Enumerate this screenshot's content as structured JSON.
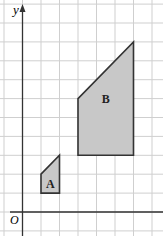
{
  "diagram": {
    "axis_labels": {
      "x": "x",
      "y": "y",
      "origin": "O"
    },
    "grid": {
      "x_range": [
        -1,
        7
      ],
      "y_range": [
        -1,
        11
      ]
    },
    "shapes": [
      {
        "label": "A",
        "vertices": [
          [
            1,
            1
          ],
          [
            2,
            1
          ],
          [
            2,
            3
          ],
          [
            1,
            2
          ]
        ],
        "fill": "#c8c8c8"
      },
      {
        "label": "B",
        "vertices": [
          [
            3,
            3
          ],
          [
            6,
            3
          ],
          [
            6,
            9
          ],
          [
            3,
            6
          ]
        ],
        "fill": "#c8c8c8"
      }
    ],
    "colors": {
      "grid": "#cfcfcf",
      "axis": "#333333",
      "outline": "#333333"
    }
  }
}
